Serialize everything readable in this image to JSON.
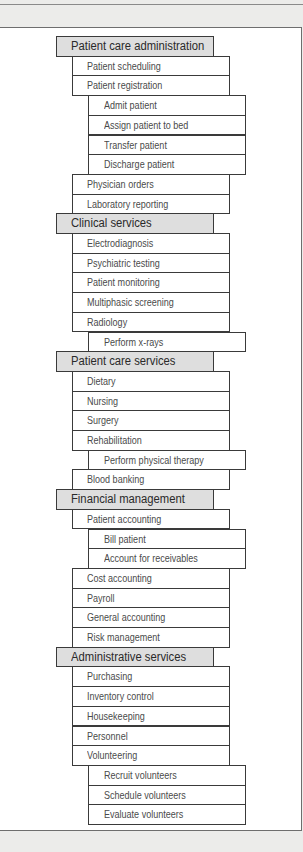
{
  "diagram": {
    "type": "functional-decomposition",
    "row_height_px": 19.7,
    "start_y_px": 36,
    "colors": {
      "background": "#ececea",
      "panel": "#ffffff",
      "category_fill": "#dedede",
      "border": "#3a3a3a",
      "category_text": "#2a2a2a",
      "item_text": "#4a4a4a"
    },
    "rows": [
      {
        "level": 0,
        "label": "Patient care administration"
      },
      {
        "level": 1,
        "label": "Patient scheduling"
      },
      {
        "level": 1,
        "label": "Patient registration"
      },
      {
        "level": 2,
        "label": "Admit patient"
      },
      {
        "level": 2,
        "label": "Assign patient to bed"
      },
      {
        "level": 2,
        "label": "Transfer patient"
      },
      {
        "level": 2,
        "label": "Discharge patient"
      },
      {
        "level": 1,
        "label": "Physician orders"
      },
      {
        "level": 1,
        "label": "Laboratory reporting"
      },
      {
        "level": 0,
        "label": "Clinical services"
      },
      {
        "level": 1,
        "label": "Electrodiagnosis"
      },
      {
        "level": 1,
        "label": "Psychiatric testing"
      },
      {
        "level": 1,
        "label": "Patient monitoring"
      },
      {
        "level": 1,
        "label": "Multiphasic screening"
      },
      {
        "level": 1,
        "label": "Radiology"
      },
      {
        "level": 2,
        "label": "Perform x-rays"
      },
      {
        "level": 0,
        "label": "Patient care services"
      },
      {
        "level": 1,
        "label": "Dietary"
      },
      {
        "level": 1,
        "label": "Nursing"
      },
      {
        "level": 1,
        "label": "Surgery"
      },
      {
        "level": 1,
        "label": "Rehabilitation"
      },
      {
        "level": 2,
        "label": "Perform physical therapy"
      },
      {
        "level": 1,
        "label": "Blood banking"
      },
      {
        "level": 0,
        "label": "Financial management"
      },
      {
        "level": 1,
        "label": "Patient accounting"
      },
      {
        "level": 2,
        "label": "Bill patient"
      },
      {
        "level": 2,
        "label": "Account for receivables"
      },
      {
        "level": 1,
        "label": "Cost accounting"
      },
      {
        "level": 1,
        "label": "Payroll"
      },
      {
        "level": 1,
        "label": "General accounting"
      },
      {
        "level": 1,
        "label": "Risk management"
      },
      {
        "level": 0,
        "label": "Administrative services"
      },
      {
        "level": 1,
        "label": "Purchasing"
      },
      {
        "level": 1,
        "label": "Inventory control"
      },
      {
        "level": 1,
        "label": "Housekeeping"
      },
      {
        "level": 1,
        "label": "Personnel"
      },
      {
        "level": 1,
        "label": "Volunteering"
      },
      {
        "level": 2,
        "label": "Recruit volunteers"
      },
      {
        "level": 2,
        "label": "Schedule volunteers"
      },
      {
        "level": 2,
        "label": "Evaluate volunteers"
      }
    ]
  }
}
